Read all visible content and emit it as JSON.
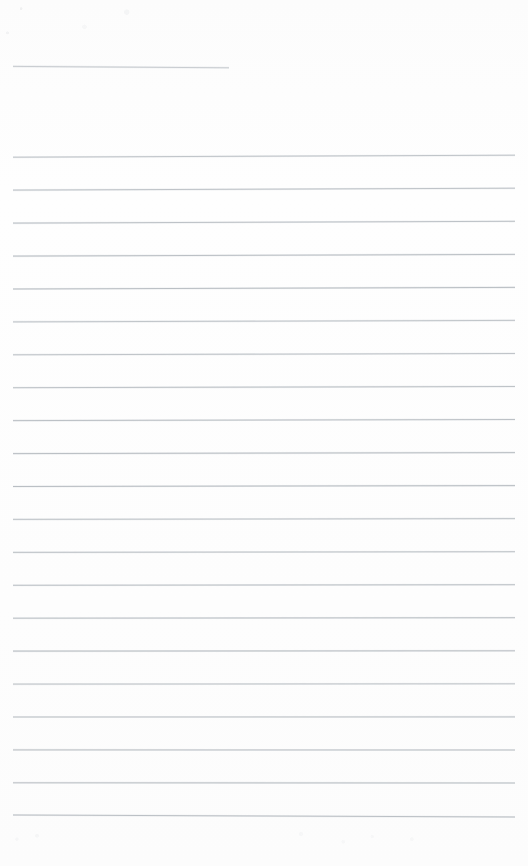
{
  "document": {
    "kind": "scanned-lined-notepaper",
    "title": "Blank ruled notepaper scan",
    "page_width": 528,
    "page_height": 866,
    "background_color": "#fdfdfd",
    "is_blank": true,
    "handwriting_present": false,
    "visible_text": ""
  },
  "ruling": {
    "line_color": "#b9bec3",
    "halo_color": "#dfe2e5",
    "line_width_px": 1,
    "left_margin_x": 13,
    "right_margin_x": 515,
    "line_spacing_px": 32.95,
    "long_line_count": 21,
    "short_line_count": 1,
    "skew_note": "lines rise about 2px from left to right except the final rule"
  },
  "lines": [
    {
      "index": 0,
      "type": "short",
      "x1": 13,
      "y1": 66.4,
      "x2": 229,
      "y2": 67.8
    },
    {
      "index": 1,
      "type": "long",
      "x1": 13,
      "y1": 157.2,
      "x2": 515,
      "y2": 155.2
    },
    {
      "index": 2,
      "type": "long",
      "x1": 13,
      "y1": 190.1,
      "x2": 515,
      "y2": 188.2
    },
    {
      "index": 3,
      "type": "long",
      "x1": 13,
      "y1": 223.1,
      "x2": 515,
      "y2": 221.3
    },
    {
      "index": 4,
      "type": "long",
      "x1": 13,
      "y1": 256.1,
      "x2": 515,
      "y2": 254.4
    },
    {
      "index": 5,
      "type": "long",
      "x1": 13,
      "y1": 289.0,
      "x2": 515,
      "y2": 287.4
    },
    {
      "index": 6,
      "type": "long",
      "x1": 13,
      "y1": 321.9,
      "x2": 515,
      "y2": 320.4
    },
    {
      "index": 7,
      "type": "long",
      "x1": 13,
      "y1": 354.8,
      "x2": 515,
      "y2": 353.5
    },
    {
      "index": 8,
      "type": "long",
      "x1": 13,
      "y1": 387.7,
      "x2": 515,
      "y2": 386.5
    },
    {
      "index": 9,
      "type": "long",
      "x1": 13,
      "y1": 420.6,
      "x2": 515,
      "y2": 419.5
    },
    {
      "index": 10,
      "type": "long",
      "x1": 13,
      "y1": 453.6,
      "x2": 515,
      "y2": 452.6
    },
    {
      "index": 11,
      "type": "long",
      "x1": 13,
      "y1": 486.5,
      "x2": 515,
      "y2": 485.6
    },
    {
      "index": 12,
      "type": "long",
      "x1": 13,
      "y1": 519.4,
      "x2": 515,
      "y2": 518.6
    },
    {
      "index": 13,
      "type": "long",
      "x1": 13,
      "y1": 552.4,
      "x2": 515,
      "y2": 551.7
    },
    {
      "index": 14,
      "type": "long",
      "x1": 13,
      "y1": 585.3,
      "x2": 515,
      "y2": 584.7
    },
    {
      "index": 15,
      "type": "long",
      "x1": 13,
      "y1": 618.2,
      "x2": 515,
      "y2": 617.7
    },
    {
      "index": 16,
      "type": "long",
      "x1": 13,
      "y1": 651.1,
      "x2": 515,
      "y2": 650.8
    },
    {
      "index": 17,
      "type": "long",
      "x1": 13,
      "y1": 684.1,
      "x2": 515,
      "y2": 683.8
    },
    {
      "index": 18,
      "type": "long",
      "x1": 13,
      "y1": 717.0,
      "x2": 515,
      "y2": 716.9
    },
    {
      "index": 19,
      "type": "long",
      "x1": 13,
      "y1": 749.9,
      "x2": 515,
      "y2": 750.0
    },
    {
      "index": 20,
      "type": "long",
      "x1": 13,
      "y1": 782.8,
      "x2": 515,
      "y2": 783.0
    },
    {
      "index": 21,
      "type": "long",
      "x1": 13,
      "y1": 815.0,
      "x2": 515,
      "y2": 817.0
    }
  ]
}
